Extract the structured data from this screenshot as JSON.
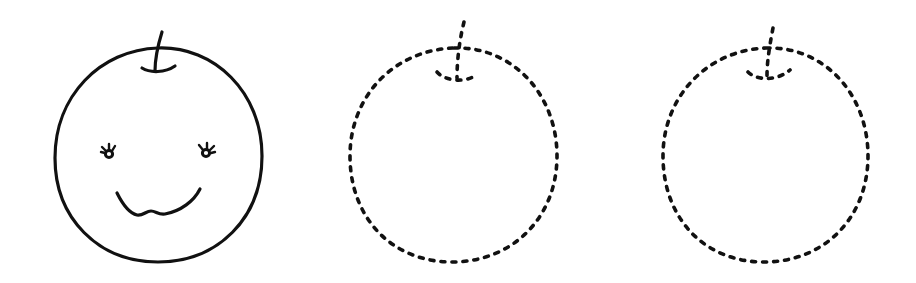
{
  "worksheet": {
    "description": "Apple tracing worksheet",
    "stroke_color": "#111111",
    "background": "#ffffff",
    "figures": [
      {
        "id": "example-apple",
        "style": "solid",
        "features": [
          "stem",
          "outline",
          "eyes",
          "smile"
        ]
      },
      {
        "id": "trace-apple-1",
        "style": "dashed",
        "features": [
          "stem",
          "outline"
        ]
      },
      {
        "id": "trace-apple-2",
        "style": "dashed",
        "features": [
          "stem",
          "outline"
        ]
      }
    ]
  }
}
